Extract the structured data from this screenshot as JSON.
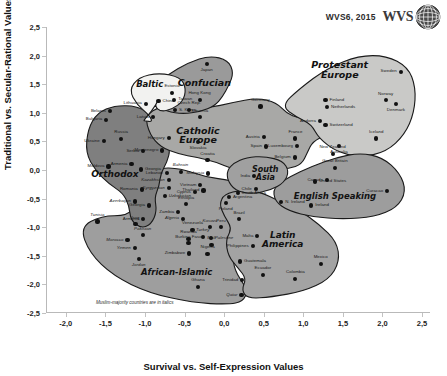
{
  "header": {
    "source_label": "WVS6, 2015",
    "logo_text": "WVS",
    "globe_icon": "globe-icon"
  },
  "axes": {
    "x_title": "Survival vs. Self-Expression Values",
    "y_title": "Traditional vs. Secular-Rational Values",
    "x_ticks": [
      "-2,0",
      "-1,5",
      "-1,0",
      "-0,5",
      "0,0",
      "0,5",
      "1,0",
      "1,5",
      "2,0",
      "2,5"
    ],
    "x_tick_values": [
      -2.0,
      -1.5,
      -1.0,
      -0.5,
      0.0,
      0.5,
      1.0,
      1.5,
      2.0,
      2.5
    ],
    "y_ticks": [
      "2,5",
      "2,0",
      "1,5",
      "1,0",
      "0,5",
      "0,0",
      "-0,5",
      "-1,0",
      "-1,5",
      "-2,0",
      "-2,5"
    ],
    "y_tick_values": [
      2.5,
      2.0,
      1.5,
      1.0,
      0.5,
      0.0,
      -0.5,
      -1.0,
      -1.5,
      -2.0,
      -2.5
    ],
    "xlim": [
      -2.25,
      2.6
    ],
    "ylim": [
      -2.5,
      2.5
    ]
  },
  "footnote": "Muslim-majority countries are in italics",
  "colors": {
    "baltic": "#f2f2f0",
    "confucian": "#9a9a9a",
    "protestant": "#c9c9c7",
    "catholic": "#a8a8a6",
    "orthodox": "#7f7f7f",
    "south_asia": "#a0a0a0",
    "english": "#9d9d9d",
    "latin": "#a3a3a3",
    "african": "#9e9e9e",
    "outline": "#1a1a1a",
    "dot": "#111111"
  },
  "clusters": [
    {
      "name": "Baltic",
      "label": "Baltic",
      "x": -0.94,
      "y": 1.5,
      "size": 8.5
    },
    {
      "name": "Confucian",
      "label": "Confucian",
      "x": -0.25,
      "y": 1.52,
      "size": 9.5
    },
    {
      "name": "Protestant Europe",
      "label": "Protestant\nEurope",
      "x": 1.46,
      "y": 1.76,
      "size": 9.5
    },
    {
      "name": "Catholic Europe",
      "label": "Catholic\nEurope",
      "x": -0.33,
      "y": 0.62,
      "size": 9.5
    },
    {
      "name": "Orthodox",
      "label": "Orthodox",
      "x": -1.38,
      "y": -0.07,
      "size": 9.0
    },
    {
      "name": "South Asia",
      "label": "South\nAsia",
      "x": 0.52,
      "y": -0.07,
      "size": 8.0
    },
    {
      "name": "English Speaking",
      "label": "English Speaking",
      "x": 1.4,
      "y": -0.45,
      "size": 8.5
    },
    {
      "name": "Latin America",
      "label": "Latin\nAmerica",
      "x": 0.74,
      "y": -1.22,
      "size": 9.0
    },
    {
      "name": "African-Islamic",
      "label": "African-Islamic",
      "x": -0.6,
      "y": -1.78,
      "size": 8.5
    }
  ],
  "chart_data": {
    "type": "scatter",
    "xlabel": "Survival vs. Self-Expression Values",
    "ylabel": "Traditional vs. Secular-Rational Values",
    "xlim": [
      -2.25,
      2.6
    ],
    "ylim": [
      -2.5,
      2.5
    ],
    "grid": false,
    "legend": "none",
    "points": [
      {
        "name": "Estonia",
        "x": -0.66,
        "y": 1.35,
        "cluster": "Baltic",
        "muslim": false,
        "pos": "T"
      },
      {
        "name": "Lithuania",
        "x": -0.99,
        "y": 1.16,
        "cluster": "Baltic",
        "muslim": false,
        "pos": "L"
      },
      {
        "name": "Latvia",
        "x": -0.9,
        "y": 0.92,
        "cluster": "Baltic",
        "muslim": false,
        "pos": "L"
      },
      {
        "name": "Japan",
        "x": -0.22,
        "y": 1.86,
        "cluster": "Confucian",
        "muslim": false,
        "pos": "B"
      },
      {
        "name": "China",
        "x": -0.83,
        "y": 1.2,
        "cluster": "Confucian",
        "muslim": false,
        "pos": "R"
      },
      {
        "name": "Taiwan",
        "x": -0.63,
        "y": 1.23,
        "cluster": "Confucian",
        "muslim": false,
        "pos": "R"
      },
      {
        "name": "S. Korea",
        "x": -0.62,
        "y": 1.05,
        "cluster": "Confucian",
        "muslim": false,
        "pos": "R"
      },
      {
        "name": "Hong Kong",
        "x": -0.31,
        "y": 1.23,
        "cluster": "Confucian",
        "muslim": false,
        "pos": "T"
      },
      {
        "name": "Sweden",
        "x": 2.23,
        "y": 1.72,
        "cluster": "Protestant Europe",
        "muslim": false,
        "pos": "L"
      },
      {
        "name": "Norway",
        "x": 2.04,
        "y": 1.22,
        "cluster": "Protestant Europe",
        "muslim": false,
        "pos": "T"
      },
      {
        "name": "Denmark",
        "x": 2.17,
        "y": 1.16,
        "cluster": "Protestant Europe",
        "muslim": false,
        "pos": "B"
      },
      {
        "name": "Finland",
        "x": 1.28,
        "y": 1.22,
        "cluster": "Protestant Europe",
        "muslim": false,
        "pos": "R"
      },
      {
        "name": "Netherlands",
        "x": 1.3,
        "y": 1.1,
        "cluster": "Protestant Europe",
        "muslim": false,
        "pos": "R"
      },
      {
        "name": "Iceland",
        "x": 1.92,
        "y": 0.55,
        "cluster": "Protestant Europe",
        "muslim": false,
        "pos": "T"
      },
      {
        "name": "Switzerland",
        "x": 1.28,
        "y": 0.78,
        "cluster": "Protestant Europe",
        "muslim": false,
        "pos": "R"
      },
      {
        "name": "Andorra",
        "x": 1.21,
        "y": 0.86,
        "cluster": "Protestant Europe",
        "muslim": false,
        "pos": "L"
      },
      {
        "name": "Germany",
        "x": 0.46,
        "y": 1.11,
        "cluster": "Catholic Europe",
        "muslim": false,
        "pos": "T"
      },
      {
        "name": "Czech Rep.",
        "x": -0.44,
        "y": 1.05,
        "cluster": "Catholic Europe",
        "muslim": false,
        "pos": "T"
      },
      {
        "name": "Slovenia",
        "x": -0.31,
        "y": 0.92,
        "cluster": "Catholic Europe",
        "muslim": false,
        "pos": "T"
      },
      {
        "name": "Hungary",
        "x": -0.7,
        "y": 0.56,
        "cluster": "Catholic Europe",
        "muslim": false,
        "pos": "L"
      },
      {
        "name": "Slovakia",
        "x": -0.33,
        "y": 0.49,
        "cluster": "Catholic Europe",
        "muslim": false,
        "pos": "B"
      },
      {
        "name": "Austria",
        "x": 0.5,
        "y": 0.58,
        "cluster": "Catholic Europe",
        "muslim": false,
        "pos": "L"
      },
      {
        "name": "France",
        "x": 0.9,
        "y": 0.55,
        "cluster": "Catholic Europe",
        "muslim": false,
        "pos": "T"
      },
      {
        "name": "Luxembourg",
        "x": 0.92,
        "y": 0.42,
        "cluster": "Catholic Europe",
        "muslim": false,
        "pos": "L"
      },
      {
        "name": "Spain",
        "x": 0.53,
        "y": 0.41,
        "cluster": "Catholic Europe",
        "muslim": false,
        "pos": "L"
      },
      {
        "name": "Belgium",
        "x": 0.89,
        "y": 0.22,
        "cluster": "Catholic Europe",
        "muslim": false,
        "pos": "L"
      },
      {
        "name": "Croatia",
        "x": -0.21,
        "y": 0.17,
        "cluster": "Catholic Europe",
        "muslim": false,
        "pos": "T"
      },
      {
        "name": "Montenegro",
        "x": -0.78,
        "y": 0.34,
        "cluster": "Catholic Europe",
        "muslim": false,
        "pos": "L"
      },
      {
        "name": "Belarus",
        "x": -1.44,
        "y": 1.03,
        "cluster": "Orthodox",
        "muslim": false,
        "pos": "L"
      },
      {
        "name": "Bulgaria",
        "x": -1.49,
        "y": 0.88,
        "cluster": "Orthodox",
        "muslim": false,
        "pos": "L"
      },
      {
        "name": "Ukraine",
        "x": -1.52,
        "y": 0.5,
        "cluster": "Orthodox",
        "muslim": false,
        "pos": "L"
      },
      {
        "name": "Russia",
        "x": -1.3,
        "y": 0.54,
        "cluster": "Orthodox",
        "muslim": false,
        "pos": "T"
      },
      {
        "name": "Serbia",
        "x": -1.02,
        "y": 0.33,
        "cluster": "Orthodox",
        "muslim": false,
        "pos": "L"
      },
      {
        "name": "Moldova",
        "x": -1.46,
        "y": 0.06,
        "cluster": "Orthodox",
        "muslim": false,
        "pos": "L"
      },
      {
        "name": "Armenia",
        "x": -1.17,
        "y": 0.1,
        "cluster": "Orthodox",
        "muslim": false,
        "pos": "L"
      },
      {
        "name": "Georgia",
        "x": -1.05,
        "y": 0.01,
        "cluster": "Orthodox",
        "muslim": false,
        "pos": "R"
      },
      {
        "name": "Romania",
        "x": -1.04,
        "y": -0.34,
        "cluster": "Orthodox",
        "muslim": false,
        "pos": "L"
      },
      {
        "name": "Azerbaijan",
        "x": -1.13,
        "y": -0.55,
        "cluster": "Orthodox",
        "muslim": true,
        "pos": "L"
      },
      {
        "name": "Georgia2",
        "x": -0.95,
        "y": -0.62,
        "cluster": "Orthodox",
        "muslim": false,
        "pos": "L"
      },
      {
        "name": "Armenia2",
        "x": -1.02,
        "y": -0.86,
        "cluster": "Orthodox",
        "muslim": false,
        "pos": "L"
      },
      {
        "name": "India",
        "x": 0.38,
        "y": -0.11,
        "cluster": "South Asia",
        "muslim": false,
        "pos": "L"
      },
      {
        "name": "Cyprus",
        "x": -0.37,
        "y": -0.38,
        "cluster": "South Asia",
        "muslim": false,
        "pos": "L"
      },
      {
        "name": "Chile",
        "x": 0.4,
        "y": -0.33,
        "cluster": "South Asia",
        "muslim": false,
        "pos": "L"
      },
      {
        "name": "United States",
        "x": 1.15,
        "y": -0.2,
        "cluster": "English Speaking",
        "muslim": false,
        "pos": "R"
      },
      {
        "name": "Australia",
        "x": 1.45,
        "y": 0.42,
        "cluster": "English Speaking",
        "muslim": false,
        "pos": "B"
      },
      {
        "name": "New Zealand",
        "x": 1.37,
        "y": 0.28,
        "cluster": "English Speaking",
        "muslim": false,
        "pos": "T"
      },
      {
        "name": "Great Britain",
        "x": 1.4,
        "y": 0.04,
        "cluster": "English Speaking",
        "muslim": false,
        "pos": "T"
      },
      {
        "name": "Canada",
        "x": 1.3,
        "y": -0.18,
        "cluster": "English Speaking",
        "muslim": false,
        "pos": "L"
      },
      {
        "name": "Curacao",
        "x": 2.06,
        "y": -0.37,
        "cluster": "English Speaking",
        "muslim": false,
        "pos": "L"
      },
      {
        "name": "Ireland",
        "x": 1.1,
        "y": -0.62,
        "cluster": "English Speaking",
        "muslim": false,
        "pos": "R"
      },
      {
        "name": "N. Ireland",
        "x": 0.72,
        "y": -0.56,
        "cluster": "English Speaking",
        "muslim": false,
        "pos": "R"
      },
      {
        "name": "Poland",
        "x": 0.02,
        "y": -0.58,
        "cluster": "Latin America",
        "muslim": false,
        "pos": "B"
      },
      {
        "name": "Argentina",
        "x": 0.06,
        "y": -0.47,
        "cluster": "Latin America",
        "muslim": false,
        "pos": "R"
      },
      {
        "name": "Brazil",
        "x": 0.19,
        "y": -0.86,
        "cluster": "Latin America",
        "muslim": false,
        "pos": "T"
      },
      {
        "name": "Peru",
        "x": -0.04,
        "y": -1.0,
        "cluster": "Latin America",
        "muslim": false,
        "pos": "T"
      },
      {
        "name": "Malta",
        "x": 0.42,
        "y": -1.15,
        "cluster": "Latin America",
        "muslim": false,
        "pos": "L"
      },
      {
        "name": "Philippines",
        "x": 0.36,
        "y": -1.33,
        "cluster": "Latin America",
        "muslim": false,
        "pos": "L"
      },
      {
        "name": "Guatemala",
        "x": 0.2,
        "y": -1.6,
        "cluster": "Latin America",
        "muslim": false,
        "pos": "R"
      },
      {
        "name": "Ecuador",
        "x": 0.49,
        "y": -1.83,
        "cluster": "Latin America",
        "muslim": false,
        "pos": "T"
      },
      {
        "name": "Colombia",
        "x": 0.9,
        "y": -1.9,
        "cluster": "Latin America",
        "muslim": false,
        "pos": "T"
      },
      {
        "name": "Mexico",
        "x": 1.22,
        "y": -1.64,
        "cluster": "Latin America",
        "muslim": false,
        "pos": "T"
      },
      {
        "name": "Trinidad",
        "x": 0.23,
        "y": -1.92,
        "cluster": "Latin America",
        "muslim": false,
        "pos": "L"
      },
      {
        "name": "Qatar",
        "x": 0.22,
        "y": -2.18,
        "cluster": "Latin America",
        "muslim": true,
        "pos": "L"
      },
      {
        "name": "Lebanon",
        "x": -0.72,
        "y": -0.05,
        "cluster": "African-Islamic",
        "muslim": false,
        "pos": "L"
      },
      {
        "name": "Bahrain",
        "x": -0.55,
        "y": -0.03,
        "cluster": "African-Islamic",
        "muslim": true,
        "pos": "T"
      },
      {
        "name": "Malaysia",
        "x": -0.2,
        "y": -0.06,
        "cluster": "African-Islamic",
        "muslim": true,
        "pos": "L"
      },
      {
        "name": "Kazakhstan",
        "x": -0.7,
        "y": -0.18,
        "cluster": "African-Islamic",
        "muslim": true,
        "pos": "L"
      },
      {
        "name": "Kyrgyzstan",
        "x": -0.7,
        "y": -0.31,
        "cluster": "African-Islamic",
        "muslim": true,
        "pos": "L"
      },
      {
        "name": "Uzbekistan",
        "x": -0.75,
        "y": -0.45,
        "cluster": "African-Islamic",
        "muslim": true,
        "pos": "R"
      },
      {
        "name": "Vietnam",
        "x": -0.3,
        "y": -0.26,
        "cluster": "African-Islamic",
        "muslim": false,
        "pos": "L"
      },
      {
        "name": "Thailand",
        "x": -0.26,
        "y": -0.36,
        "cluster": "African-Islamic",
        "muslim": false,
        "pos": "L"
      },
      {
        "name": "South Africa",
        "x": 0.17,
        "y": -0.4,
        "cluster": "African-Islamic",
        "muslim": false,
        "pos": "R"
      },
      {
        "name": "Ethiopia",
        "x": -0.48,
        "y": -0.6,
        "cluster": "African-Islamic",
        "muslim": false,
        "pos": "T"
      },
      {
        "name": "Zambia",
        "x": -0.58,
        "y": -0.74,
        "cluster": "African-Islamic",
        "muslim": false,
        "pos": "L"
      },
      {
        "name": "Algeria",
        "x": -0.52,
        "y": -0.85,
        "cluster": "African-Islamic",
        "muslim": true,
        "pos": "L"
      },
      {
        "name": "Tunisia",
        "x": -1.6,
        "y": -0.9,
        "cluster": "African-Islamic",
        "muslim": true,
        "pos": "T"
      },
      {
        "name": "Iraq",
        "x": -1.12,
        "y": -0.95,
        "cluster": "African-Islamic",
        "muslim": true,
        "pos": "T"
      },
      {
        "name": "Pakistan",
        "x": -1.03,
        "y": -1.14,
        "cluster": "African-Islamic",
        "muslim": true,
        "pos": "T"
      },
      {
        "name": "Venezuela",
        "x": -0.4,
        "y": -1.05,
        "cluster": "African-Islamic",
        "muslim": false,
        "pos": "T"
      },
      {
        "name": "Kosovo",
        "x": -0.18,
        "y": -1.0,
        "cluster": "African-Islamic",
        "muslim": true,
        "pos": "T"
      },
      {
        "name": "Rwanda",
        "x": -0.45,
        "y": -1.2,
        "cluster": "African-Islamic",
        "muslim": false,
        "pos": "T"
      },
      {
        "name": "Turkey",
        "x": -0.27,
        "y": -1.17,
        "cluster": "African-Islamic",
        "muslim": true,
        "pos": "T"
      },
      {
        "name": "Palestine",
        "x": -0.17,
        "y": -1.19,
        "cluster": "African-Islamic",
        "muslim": true,
        "pos": "R"
      },
      {
        "name": "Burkina Faso",
        "x": -0.45,
        "y": -1.28,
        "cluster": "African-Islamic",
        "muslim": false,
        "pos": "T"
      },
      {
        "name": "Mali",
        "x": -0.16,
        "y": -1.31,
        "cluster": "African-Islamic",
        "muslim": true,
        "pos": "T"
      },
      {
        "name": "Morocco",
        "x": -1.22,
        "y": -1.22,
        "cluster": "African-Islamic",
        "muslim": true,
        "pos": "L"
      },
      {
        "name": "Yemen",
        "x": -1.13,
        "y": -1.37,
        "cluster": "African-Islamic",
        "muslim": true,
        "pos": "L"
      },
      {
        "name": "Zimbabwe",
        "x": -0.44,
        "y": -1.46,
        "cluster": "African-Islamic",
        "muslim": false,
        "pos": "L"
      },
      {
        "name": "Nigeria",
        "x": -0.21,
        "y": -1.47,
        "cluster": "African-Islamic",
        "muslim": false,
        "pos": "T"
      },
      {
        "name": "Jordan",
        "x": -1.08,
        "y": -1.55,
        "cluster": "African-Islamic",
        "muslim": true,
        "pos": "B"
      },
      {
        "name": "Ghana",
        "x": -0.33,
        "y": -2.04,
        "cluster": "African-Islamic",
        "muslim": false,
        "pos": "T"
      }
    ]
  }
}
